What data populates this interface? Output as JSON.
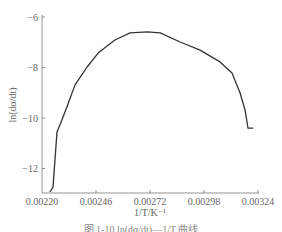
{
  "chart_data": {
    "type": "line",
    "title": "",
    "xlabel": "1/T/K⁻¹",
    "ylabel": "ln(dα/dt)",
    "xlim": [
      0.0022,
      0.00324
    ],
    "ylim": [
      -13,
      -6
    ],
    "xticks": [
      0.0022,
      0.00246,
      0.00272,
      0.00298,
      0.00324
    ],
    "xtick_labels": [
      "0.00220",
      "0.00246",
      "0.00272",
      "0.00298",
      "0.00324"
    ],
    "yticks": [
      -6,
      -8,
      -10,
      -12
    ],
    "ytick_labels": [
      "-6",
      "-8",
      "-10",
      "-12"
    ],
    "grid": false,
    "legend": null,
    "series": [
      {
        "name": "ln(dα/dt)",
        "color": "#333333",
        "x": [
          0.002238,
          0.002253,
          0.002272,
          0.002286,
          0.00232,
          0.002359,
          0.002417,
          0.00247,
          0.002551,
          0.002624,
          0.002706,
          0.002769,
          0.002865,
          0.002961,
          0.003057,
          0.003115,
          0.003154,
          0.003178,
          0.003192,
          0.003217
        ],
        "y": [
          -12.93,
          -12.73,
          -10.55,
          -10.28,
          -9.56,
          -8.69,
          -7.98,
          -7.43,
          -6.91,
          -6.63,
          -6.59,
          -6.63,
          -6.99,
          -7.31,
          -7.78,
          -8.22,
          -9.01,
          -9.69,
          -10.4,
          -10.4
        ]
      }
    ]
  },
  "axes": {
    "xlabel": "1/T/K⁻¹",
    "ylabel": "ln(dα/dt)",
    "xtick_labels": [
      "0.00220",
      "0.00246",
      "0.00272",
      "0.00298",
      "0.00324"
    ],
    "ytick_labels": [
      "-6",
      "-8",
      "-10",
      "-12"
    ]
  },
  "caption": "图 1-10  ln(dα/dt)—1/T 曲线"
}
